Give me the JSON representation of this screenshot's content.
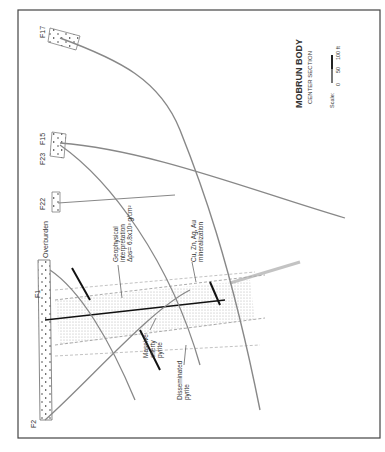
{
  "title": "MOBRUN BODY",
  "subtitle": "CENTER SECTION",
  "scale": {
    "label": "Scale:",
    "ticks": [
      "0",
      "50",
      "100 ft"
    ]
  },
  "drillholes": [
    {
      "id": "F17"
    },
    {
      "id": "F15"
    },
    {
      "id": "F23"
    },
    {
      "id": "F22"
    },
    {
      "id": "F1"
    },
    {
      "id": "F2"
    }
  ],
  "labels": {
    "overburden": "Overburden",
    "geophysical": [
      "Geophysical",
      "interpretation",
      "Δρs= 6.8x10³ g/cm²"
    ],
    "mineralization": [
      "Cu, Zn, Ag, Au",
      "mineralization"
    ],
    "massive": [
      "Massive",
      "cherty",
      "pyrite"
    ],
    "disseminated": [
      "Disseminated",
      "pyrite"
    ]
  },
  "colors": {
    "line": "#888888",
    "ink": "#222222",
    "frame": "#444444"
  }
}
